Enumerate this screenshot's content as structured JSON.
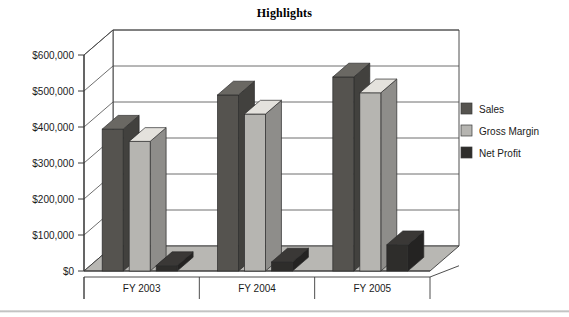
{
  "chart_data": {
    "type": "bar",
    "title": "Highlights",
    "xlabel": "",
    "ylabel": "",
    "categories": [
      "FY 2003",
      "FY 2004",
      "FY 2005"
    ],
    "series": [
      {
        "name": "Sales",
        "values": [
          394000,
          489000,
          539000
        ],
        "color": "#55534f"
      },
      {
        "name": "Gross Margin",
        "values": [
          360000,
          436000,
          495000
        ],
        "color": "#b6b5b1"
      },
      {
        "name": "Net Profit",
        "values": [
          15000,
          25000,
          73000
        ],
        "color": "#2e2d2b"
      }
    ],
    "ylim": [
      0,
      600000
    ],
    "ytick_values": [
      0,
      100000,
      200000,
      300000,
      400000,
      500000,
      600000
    ],
    "ytick_labels": [
      "$0",
      "$100,000",
      "$200,000",
      "$300,000",
      "$400,000",
      "$500,000",
      "$600,000"
    ],
    "grid": true,
    "legend_position": "right",
    "projection": "3d"
  },
  "legend": {
    "items": [
      {
        "label": "Sales",
        "swatch": "#55534f"
      },
      {
        "label": "Gross Margin",
        "swatch": "#b6b5b1"
      },
      {
        "label": "Net Profit",
        "swatch": "#2e2d2b"
      }
    ]
  },
  "style": {
    "background": "#ffffff",
    "axis_line": "#3a3a3a",
    "grid_line": "#4a4a4a",
    "floor_fill": "#b8b7b3",
    "wall_fill": "#ffffff",
    "text_color": "#1a1a1a"
  }
}
